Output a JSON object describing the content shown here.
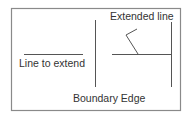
{
  "diagram": {
    "labels": {
      "line_to_extend": "Line to extend",
      "extended_line": "Extended line",
      "boundary_edge": "Boundary Edge"
    },
    "colors": {
      "background": "#ffffff",
      "frame": "#8a8a8a",
      "lines": "#555555",
      "text": "#333333"
    },
    "elements": {
      "frame": {
        "x": 11,
        "y": 8,
        "width": 169,
        "height": 102
      },
      "line_to_extend": {
        "x1": 24,
        "y1": 54,
        "x2": 83,
        "y2": 54
      },
      "boundary_left": {
        "x1": 95,
        "y1": 20,
        "x2": 95,
        "y2": 87
      },
      "extended_line": {
        "x1": 112,
        "y1": 54,
        "x2": 171,
        "y2": 54
      },
      "boundary_right": {
        "x1": 171,
        "y1": 22,
        "x2": 171,
        "y2": 87
      },
      "leader_line": {
        "points": "137,29 126,35 138,54"
      }
    }
  }
}
